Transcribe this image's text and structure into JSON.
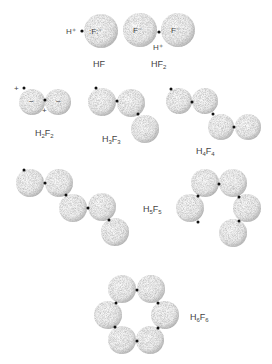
{
  "diagram": {
    "type": "molecular-structures",
    "colors": {
      "atom_fill": "#f2f2f2",
      "atom_shade": "#9a9a9a",
      "proton_dot": "#111111",
      "label": "#444444"
    },
    "molecules": [
      {
        "id": "HF",
        "label_main": "HF",
        "label_sub": "",
        "annotations": {
          "h": "H⁺",
          "f": ":F:⁻"
        }
      },
      {
        "id": "HF2",
        "label_main": "HF",
        "label_sub": "2",
        "annotations": {
          "f_left": "F⁻",
          "f_right": "F⁻",
          "h": "H⁺"
        }
      },
      {
        "id": "H2F2",
        "label_h": "H",
        "label_h_sub": "2",
        "label_f": "F",
        "label_f_sub": "2",
        "annotations": {
          "plus_top": "+",
          "plus_bottom": "+",
          "minus_left": "−",
          "minus_right": "−"
        }
      },
      {
        "id": "H3F3",
        "label_h": "H",
        "label_h_sub": "3",
        "label_f": "F",
        "label_f_sub": "3"
      },
      {
        "id": "H4F4",
        "label_h": "H",
        "label_h_sub": "4",
        "label_f": "F",
        "label_f_sub": "4"
      },
      {
        "id": "H5F5",
        "label_h": "H",
        "label_h_sub": "5",
        "label_f": "F",
        "label_f_sub": "5",
        "forms": [
          "chain",
          "ring"
        ]
      },
      {
        "id": "H6F6",
        "label_h": "H",
        "label_h_sub": "6",
        "label_f": "F",
        "label_f_sub": "6",
        "forms": [
          "ring"
        ]
      }
    ]
  }
}
